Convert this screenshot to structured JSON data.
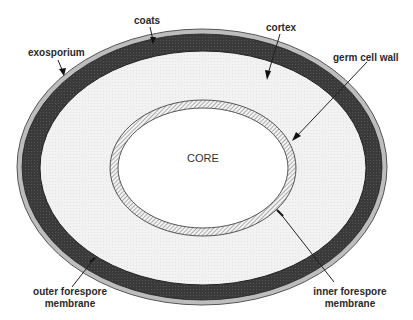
{
  "diagram": {
    "title": "",
    "layers_outer_to_inner": [
      {
        "id": "exosporium",
        "label": "exosporium",
        "fill": "#bdbdbd"
      },
      {
        "id": "coats",
        "label": "coats",
        "fill": "#3a3a3a"
      },
      {
        "id": "outer_forespore_membrane",
        "label": "outer forespore membrane",
        "fill": "#222222"
      },
      {
        "id": "cortex",
        "label": "cortex",
        "fill": "#f1f1f1"
      },
      {
        "id": "germ_cell_wall",
        "label": "germ cell wall",
        "fill": "hatched"
      },
      {
        "id": "inner_forespore_membrane",
        "label": "inner forespore membrane",
        "fill": "#222222"
      },
      {
        "id": "core",
        "label": "CORE",
        "fill": "#ffffff"
      }
    ],
    "labels": {
      "coats": "coats",
      "cortex": "cortex",
      "exosporium": "exosporium",
      "germ_cell_wall": "germ cell wall",
      "core": "CORE",
      "outer_forespore_membrane_line1": "outer forespore",
      "outer_forespore_membrane_line2": "membrane",
      "inner_forespore_membrane_line1": "inner forespore",
      "inner_forespore_membrane_line2": "membrane"
    }
  }
}
